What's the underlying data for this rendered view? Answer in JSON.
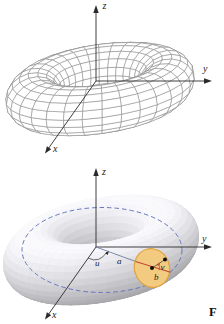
{
  "top_figure": {
    "axis_labels": {
      "x": "x",
      "y": "y",
      "z": "z"
    }
  },
  "bottom_figure": {
    "axis_labels": {
      "x": "x",
      "y": "y",
      "z": "z"
    },
    "labels": {
      "u": "u",
      "v": "v",
      "a": "a",
      "b": "b"
    },
    "caption_fragment": "F"
  },
  "colors": {
    "wireframe_stroke": "#8a8a8a",
    "wireframe_fill": "#ffffff",
    "solid_base_gray": "#cdced2",
    "dashed_circle": "#6577bd",
    "disc_fill": "#f3cb80",
    "disc_stroke": "#dfa23e",
    "red_line": "#bf4a32",
    "a_line": "#6e7da0"
  }
}
